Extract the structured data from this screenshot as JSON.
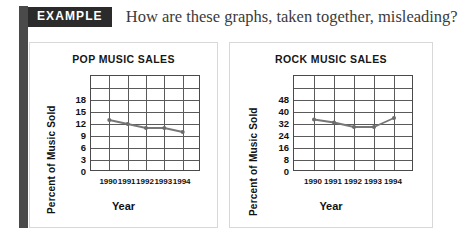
{
  "header": {
    "badge_label": "EXAMPLE",
    "question": "How are these graphs, taken together, misleading?"
  },
  "colors": {
    "badge_background": "#2b2b2b",
    "badge_text": "#ffffff",
    "spine": "#4a4a4a",
    "panel_border": "#d8d8d8",
    "plot_border": "#4a4a4a",
    "gridline": "#5a5a5a",
    "series_line": "#777777",
    "series_marker": "#6b6b6b",
    "text": "#111111",
    "question_text": "#3b3b3b"
  },
  "charts": [
    {
      "panel_name": "pop-music-sales-panel",
      "title": "POP MUSIC SALES",
      "ylabel": "Percent of Music Sold",
      "xlabel": "Year"
    },
    {
      "panel_name": "rock-music-sales-panel",
      "title": "ROCK MUSIC SALES",
      "ylabel": "Percent of Music Sold",
      "xlabel": "Year"
    }
  ],
  "chart_data": [
    {
      "type": "line",
      "title": "POP MUSIC SALES",
      "xlabel": "Year",
      "ylabel": "Percent of Music Sold",
      "categories": [
        "1990",
        "1991",
        "1992",
        "1993",
        "1994"
      ],
      "values": [
        13,
        12,
        11,
        11,
        10
      ],
      "yticks": [
        0,
        3,
        6,
        9,
        12,
        15,
        18
      ],
      "ylim": [
        0,
        24
      ],
      "grid": true,
      "grid_columns": 6,
      "grid_rows": 8,
      "legend": "none",
      "markers": true
    },
    {
      "type": "line",
      "title": "ROCK MUSIC SALES",
      "xlabel": "Year",
      "ylabel": "Percent of Music Sold",
      "categories": [
        "1990",
        "1991",
        "1992",
        "1993",
        "1994"
      ],
      "values": [
        35,
        33,
        30,
        30,
        36
      ],
      "yticks": [
        0,
        8,
        16,
        24,
        32,
        40,
        48
      ],
      "ylim": [
        0,
        64
      ],
      "grid": true,
      "grid_columns": 6,
      "grid_rows": 8,
      "legend": "none",
      "markers": true
    }
  ]
}
